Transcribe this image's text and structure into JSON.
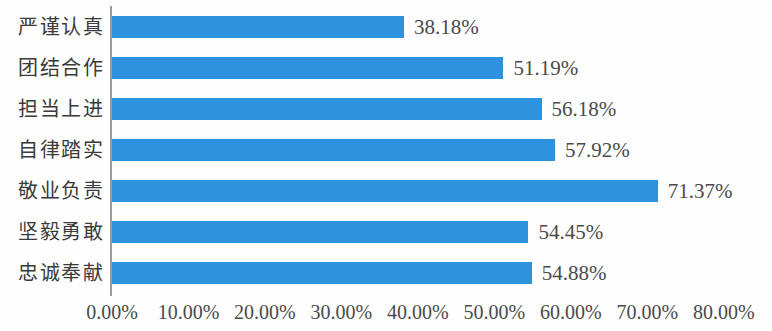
{
  "chart_data": {
    "type": "bar",
    "orientation": "horizontal",
    "title": "",
    "subtitle": "",
    "xlabel": "",
    "ylabel": "",
    "grid": false,
    "legend": null,
    "xlim": [
      0,
      80
    ],
    "x_tick_labels": [
      "0.00%",
      "10.00%",
      "20.00%",
      "30.00%",
      "40.00%",
      "50.00%",
      "60.00%",
      "70.00%",
      "80.00%"
    ],
    "x_tick_values": [
      0,
      10,
      20,
      30,
      40,
      50,
      60,
      70,
      80
    ],
    "categories": [
      "严谨认真",
      "团结合作",
      "担当上进",
      "自律踏实",
      "敬业负责",
      "坚毅勇敢",
      "忠诚奉献"
    ],
    "values": [
      38.18,
      51.19,
      56.18,
      57.92,
      71.37,
      54.45,
      54.88
    ],
    "value_labels": [
      "38.18%",
      "51.19%",
      "56.18%",
      "57.92%",
      "71.37%",
      "54.45%",
      "54.88%"
    ],
    "bar_color": "#2e93de",
    "axis_color": "#9a9a9a",
    "text_color": "#4a4a4a",
    "background_color": "#fefefe"
  }
}
